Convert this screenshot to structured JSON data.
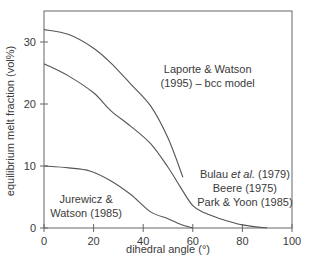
{
  "chart_data": {
    "type": "line",
    "title": "",
    "xlabel": "dihedral angle (°)",
    "ylabel": "equilibrium melt fraction (vol%)",
    "xlim": [
      0,
      100
    ],
    "ylim": [
      0,
      35
    ],
    "xticks": [
      0,
      20,
      40,
      60,
      80,
      100
    ],
    "yticks": [
      0,
      10,
      20,
      30
    ],
    "grid": false,
    "legend": "none (curves labeled directly)",
    "series": [
      {
        "name": "Laporte & Watson (1995) – bcc model",
        "x": [
          0,
          10,
          20,
          27,
          35,
          43,
          50,
          56
        ],
        "y": [
          32.0,
          31.2,
          29.0,
          26.6,
          23.2,
          19.7,
          14.5,
          8.2
        ]
      },
      {
        "name": "Bulau et al. (1979), Beere (1975), Park & Yoon (1985)",
        "x": [
          0,
          10,
          20,
          27,
          35,
          43,
          50,
          55,
          60,
          65,
          71,
          80,
          90
        ],
        "y": [
          26.5,
          24.5,
          21.8,
          18.9,
          16.4,
          13.6,
          9.8,
          6.6,
          3.6,
          2.4,
          1.5,
          0.5,
          0.0
        ]
      },
      {
        "name": "Jurewicz & Watson (1985)",
        "x": [
          0,
          10,
          18.5,
          27,
          35,
          43,
          50,
          55,
          60
        ],
        "y": [
          10.0,
          9.7,
          9.2,
          7.6,
          5.4,
          2.6,
          1.5,
          0.6,
          0.0
        ]
      }
    ],
    "annotations": [
      {
        "lines": [
          "Laporte & Watson",
          "(1995) – bcc model"
        ],
        "x": 66,
        "y": 25
      },
      {
        "lines": [
          "Bulau et al. (1979)",
          "Beere (1975)",
          "Park & Yoon (1985)"
        ],
        "x": 81,
        "y": 8
      },
      {
        "lines": [
          "Jurewicz &",
          "Watson (1985)"
        ],
        "x": 17,
        "y": 4
      }
    ]
  },
  "colors": {
    "line": "#555555",
    "axis": "#666666",
    "text": "#3a3a3a"
  }
}
